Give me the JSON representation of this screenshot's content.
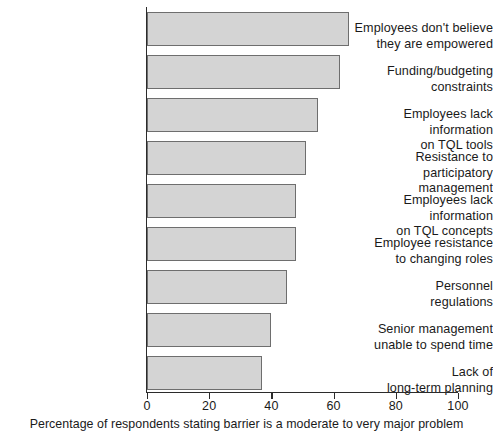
{
  "chart_data": {
    "type": "bar",
    "orientation": "horizontal",
    "title": "",
    "subtitle": "",
    "xlabel": "Percentage of respondents stating barrier is a moderate to very major problem",
    "ylabel": "",
    "xlim": [
      0,
      100
    ],
    "xticks": [
      0,
      20,
      40,
      60,
      80,
      100
    ],
    "xtick_labels": [
      "0",
      "20",
      "40",
      "60",
      "80",
      "100"
    ],
    "grid": false,
    "legend": null,
    "categories": [
      "Employees don't believe\nthey are empowered",
      "Funding/budgeting\nconstraints",
      "Employees lack information\non TQL tools",
      "Resistance to\nparticipatory management",
      "Employees lack information\non TQL concepts",
      "Employee resistance\nto changing roles",
      "Personnel\nregulations",
      "Senior management\nunable to spend time",
      "Lack of\nlong-term planning"
    ],
    "values": [
      65,
      62,
      55,
      51,
      48,
      48,
      45,
      40,
      37
    ],
    "bar_fill_color": "#d4d4d4",
    "bar_edge_color": "#6e6e6e",
    "axis_color": "#2b2b2b"
  }
}
